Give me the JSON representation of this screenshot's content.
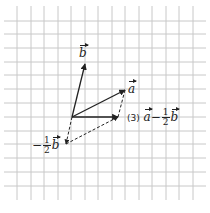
{
  "diagram": {
    "grid": {
      "x_lines": [
        17,
        31,
        44,
        58,
        71,
        85,
        98,
        112,
        125,
        139,
        152,
        166,
        179,
        193
      ],
      "y_lines": [
        21,
        34,
        48,
        62,
        75,
        89,
        103,
        117,
        131,
        144,
        158,
        172,
        186
      ],
      "x_extent": [
        4,
        206
      ],
      "y_extent": [
        6,
        200
      ],
      "color": "#c8c8c8"
    },
    "origin": {
      "x": 72,
      "y": 117
    },
    "vectors": [
      {
        "name": "b",
        "to": {
          "x": 85,
          "y": 64
        },
        "style": "solid"
      },
      {
        "name": "a",
        "to": {
          "x": 125,
          "y": 90
        },
        "style": "solid"
      },
      {
        "name": "minus-half-b",
        "to": {
          "x": 66,
          "y": 144
        },
        "style": "dashed"
      },
      {
        "name": "result",
        "to": {
          "x": 118,
          "y": 117
        },
        "style": "solid"
      }
    ],
    "labels": {
      "b": {
        "var": "b"
      },
      "a": {
        "var": "a"
      },
      "minus_half_b": {
        "sign": "−",
        "num": "1",
        "den": "2",
        "var": "b"
      },
      "result": {
        "tag": "(3)",
        "var1": "a",
        "op": "−",
        "num": "1",
        "den": "2",
        "var2": "b"
      }
    },
    "line_color": "#222222"
  }
}
